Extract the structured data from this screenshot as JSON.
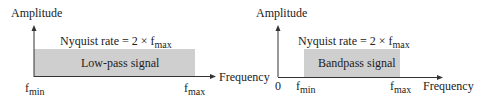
{
  "diagrams": [
    {
      "id": "low-pass",
      "y_axis_label": "Amplitude",
      "x_axis_label": "Frequency",
      "nyquist": {
        "prefix": "Nyquist rate = 2 × ",
        "f": "f",
        "sub": "max"
      },
      "band_label": "Low-pass signal",
      "ticks": [
        {
          "f": "f",
          "sub": "min"
        },
        {
          "f": "f",
          "sub": "max"
        }
      ],
      "band_color": "#cfcfcf"
    },
    {
      "id": "bandpass",
      "y_axis_label": "Amplitude",
      "x_axis_label": "Frequency",
      "nyquist": {
        "prefix": "Nyquist rate = 2 × ",
        "f": "f",
        "sub": "max"
      },
      "band_label": "Bandpass signal",
      "origin_label": "0",
      "ticks": [
        {
          "f": "f",
          "sub": "min"
        },
        {
          "f": "f",
          "sub": "max"
        }
      ],
      "band_color": "#cfcfcf"
    }
  ],
  "colors": {
    "axis": "#333333",
    "band": "#cfcfcf",
    "text": "#222222"
  }
}
